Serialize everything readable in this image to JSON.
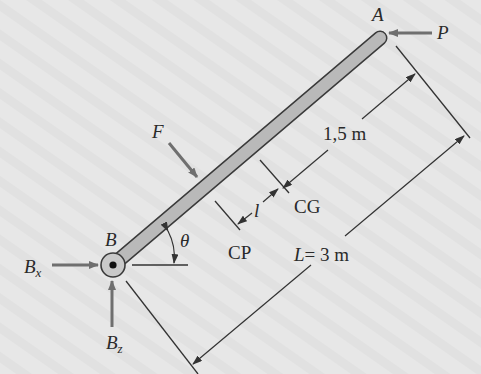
{
  "figure": {
    "colors": {
      "background": "#e6e6e6",
      "rod_fill": "#b9b9b9",
      "rod_outline": "#3a3a3a",
      "force_arrow": "#6f6f6f",
      "dimension_line": "#333333",
      "text": "#2a2a2a"
    },
    "points": {
      "A": "A",
      "B": "B"
    },
    "forces": {
      "P": "P",
      "F": "F",
      "Bx": {
        "main": "B",
        "sub": "x"
      },
      "Bz": {
        "main": "B",
        "sub": "z"
      }
    },
    "angle": "θ",
    "markers": {
      "CP": "CP",
      "CG": "CG",
      "l": "l"
    },
    "dimensions": {
      "half_length": "1,5 m",
      "total_length": {
        "var": "L",
        "value": "= 3 m"
      }
    }
  }
}
